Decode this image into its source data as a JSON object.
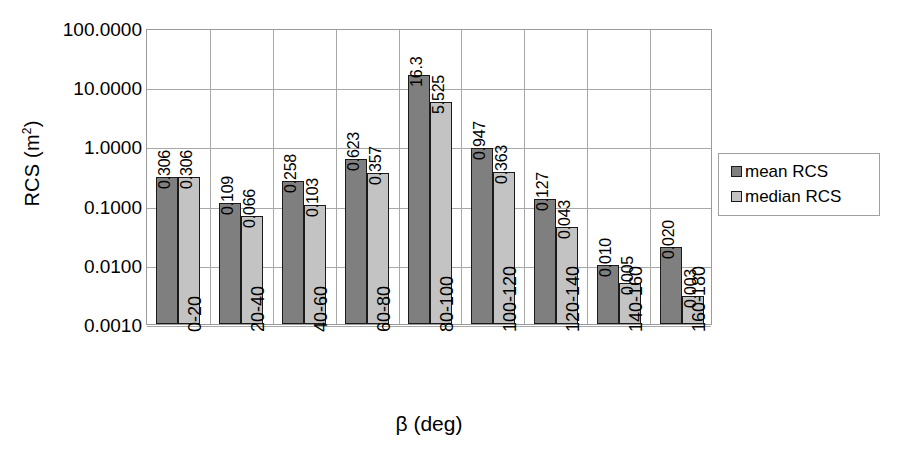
{
  "chart_data": {
    "type": "bar",
    "title": "",
    "xlabel": "β (deg)",
    "ylabel": "RCS (m²)",
    "ylabel_base": "RCS (m",
    "ylabel_sup": "2",
    "ylabel_tail": ")",
    "yscale": "log",
    "ylim": [
      0.001,
      100
    ],
    "grid": true,
    "legend_position": "right",
    "categories": [
      "0-20",
      "20-40",
      "40-60",
      "60-80",
      "80-100",
      "100-120",
      "120-140",
      "140-160",
      "160-180"
    ],
    "ytick_labels": [
      "100.0000",
      "10.0000",
      "1.0000",
      "0.1000",
      "0.0100",
      "0.0010"
    ],
    "ytick_values": [
      100,
      10,
      1,
      0.1,
      0.01,
      0.001
    ],
    "series": [
      {
        "name": "mean RCS",
        "color": "#7f7f7f",
        "values": [
          0.306,
          0.109,
          0.258,
          0.623,
          16.3,
          0.947,
          0.127,
          0.01,
          0.02
        ],
        "labels": [
          "0.306",
          "0.109",
          "0.258",
          "0.623",
          "16.3",
          "0.947",
          "0.127",
          "0.010",
          "0.020"
        ]
      },
      {
        "name": "median RCS",
        "color": "#c3c3c3",
        "values": [
          0.306,
          0.066,
          0.103,
          0.357,
          5.525,
          0.363,
          0.043,
          0.005,
          0.003
        ],
        "labels": [
          "0.306",
          "0.066",
          "0.103",
          "0.357",
          "5.525",
          "0.363",
          "0.043",
          "0.005",
          "0.003"
        ]
      }
    ]
  },
  "legend": {
    "items": [
      {
        "label": "mean RCS",
        "color": "#7f7f7f"
      },
      {
        "label": "median RCS",
        "color": "#c3c3c3"
      }
    ]
  },
  "axes": {
    "x_title": "β (deg)",
    "y_title_base": "RCS (m",
    "y_title_sup": "2",
    "y_title_tail": ")"
  }
}
